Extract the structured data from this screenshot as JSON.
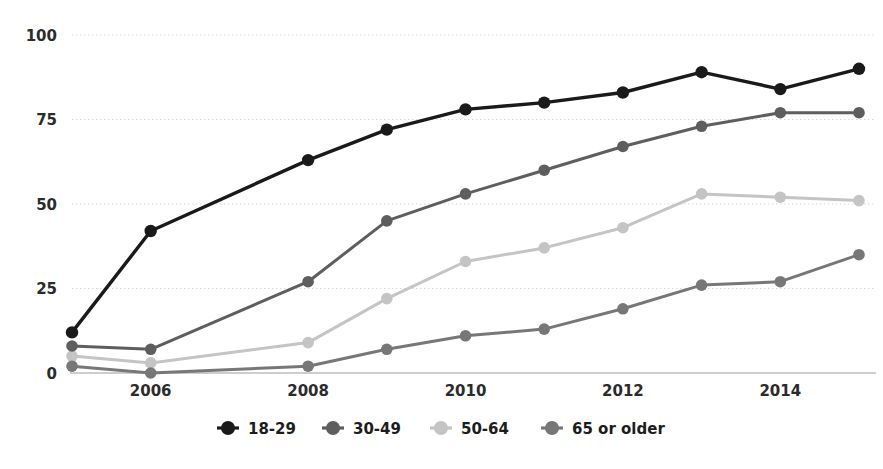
{
  "chart_data": {
    "type": "line",
    "title": "",
    "subtitle": "",
    "xlabel": "",
    "ylabel": "",
    "x": [
      2005,
      2006,
      2008,
      2009,
      2010,
      2011,
      2012,
      2013,
      2014,
      2015
    ],
    "xlim": [
      2005,
      2015
    ],
    "ylim": [
      0,
      100
    ],
    "yticks": [
      0,
      25,
      50,
      75,
      100
    ],
    "ytick_labels": [
      "0",
      "25",
      "50",
      "75",
      "100"
    ],
    "xticks": [
      2006,
      2008,
      2010,
      2012,
      2014
    ],
    "xtick_labels": [
      "2006",
      "2008",
      "2010",
      "2012",
      "2014"
    ],
    "grid": "horizontal-dotted",
    "legend_position": "bottom-center",
    "markers": "filled-circle",
    "series": [
      {
        "name": "18-29",
        "color": "#1a1a1a",
        "values": [
          12,
          42,
          63,
          72,
          78,
          80,
          83,
          89,
          84,
          90
        ]
      },
      {
        "name": "30-49",
        "color": "#5e5e5e",
        "values": [
          8,
          7,
          27,
          45,
          53,
          60,
          67,
          73,
          77,
          77
        ]
      },
      {
        "name": "50-64",
        "color": "#c4c4c4",
        "values": [
          5,
          3,
          9,
          22,
          33,
          37,
          43,
          53,
          52,
          51
        ]
      },
      {
        "name": "65 or older",
        "color": "#777777",
        "values": [
          2,
          0,
          2,
          7,
          11,
          13,
          19,
          26,
          27,
          35
        ]
      }
    ]
  },
  "legend": {
    "entries": [
      {
        "label": "18-29"
      },
      {
        "label": "30-49"
      },
      {
        "label": "50-64"
      },
      {
        "label": "65 or older"
      }
    ]
  },
  "colors": {
    "background": "#ffffff",
    "grid": "#d8d8d8",
    "axis": "#bdbdbd",
    "text": "#2b2b2b"
  }
}
